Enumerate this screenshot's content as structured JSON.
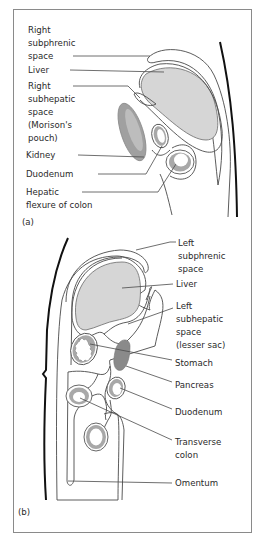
{
  "panel_a": {
    "tag": "(a)",
    "labels": {
      "right_subphrenic": [
        "Right",
        "subphrenic",
        "space"
      ],
      "liver": [
        "Liver"
      ],
      "right_subhepatic": [
        "Right",
        "subhepatic",
        "space",
        "(Morison's",
        "pouch)"
      ],
      "kidney": [
        "Kidney"
      ],
      "duodenum": [
        "Duodenum"
      ],
      "hepatic_flexure": [
        "Hepatic",
        "flexure of colon"
      ]
    }
  },
  "panel_b": {
    "tag": "(b)",
    "labels": {
      "left_subphrenic": [
        "Left",
        "subphrenic",
        "space"
      ],
      "liver": [
        "Liver"
      ],
      "left_subhepatic": [
        "Left",
        "subhepatic",
        "space",
        "(lesser sac)"
      ],
      "stomach": [
        "Stomach"
      ],
      "pancreas": [
        "Pancreas"
      ],
      "duodenum": [
        "Duodenum"
      ],
      "transverse_colon": [
        "Transverse",
        "colon"
      ],
      "omentum": [
        "Omentum"
      ]
    }
  },
  "colors": {
    "organ_fill": "#d6d6d6",
    "space_fill": "#efefef",
    "kidney_fill": "#9a9a9a",
    "pancreas_fill": "#8a8a8a",
    "gut_wall": "#a8a8a8"
  }
}
